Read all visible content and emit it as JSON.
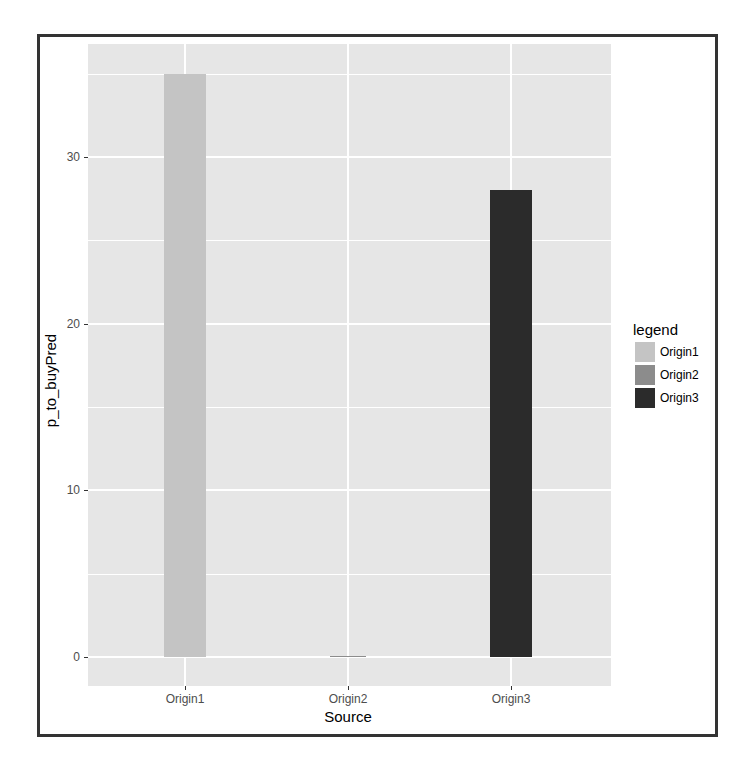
{
  "chart_data": {
    "type": "bar",
    "title": "",
    "xlabel": "Source",
    "ylabel": "p_to_buyPred",
    "categories": [
      "Origin1",
      "Origin2",
      "Origin3"
    ],
    "values": [
      35,
      0,
      28
    ],
    "colors": [
      "#c4c4c4",
      "#8c8c8c",
      "#2b2b2b"
    ],
    "ylim": [
      -2,
      37
    ],
    "yticks": [
      0,
      10,
      20,
      30
    ],
    "ytick_labels": [
      "0",
      "10",
      "20",
      "30"
    ],
    "grid": true,
    "legend": {
      "title": "legend",
      "position": "right",
      "entries": [
        {
          "label": "Origin1",
          "color": "#c4c4c4"
        },
        {
          "label": "Origin2",
          "color": "#8c8c8c"
        },
        {
          "label": "Origin3",
          "color": "#2b2b2b"
        }
      ]
    }
  }
}
